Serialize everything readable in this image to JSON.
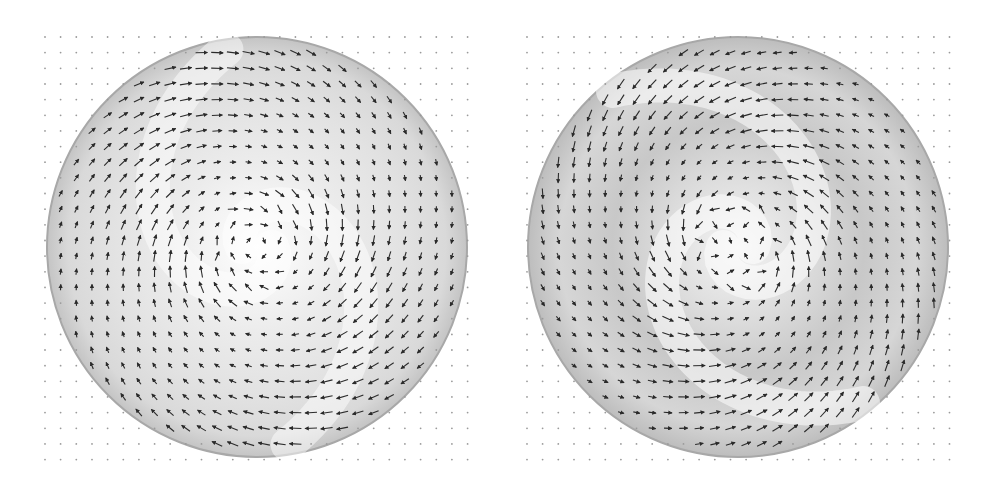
{
  "figure": {
    "background": "#ffffff",
    "dot_color": "#9a9a9a",
    "arrow_color": "#2a2a2a",
    "disc_edge_color": "#a8a8a8",
    "grid": {
      "cols": 28,
      "rows": 28,
      "spacing": 15.65
    }
  },
  "panels": [
    {
      "id": "left",
      "label": "Two-arm spiral vector field (counter-clockwise rotation, inward-spiraling)",
      "origin": {
        "x": 45,
        "y": 37
      },
      "center": {
        "x": 257,
        "y": 247
      },
      "radius": 210,
      "arms": 2,
      "twist": 1.1,
      "rotation": 1,
      "shading": "light"
    },
    {
      "id": "right",
      "label": "Two-arm spiral vector field with vortex core (clockwise rotation, darker shaded bands)",
      "origin": {
        "x": 527,
        "y": 37
      },
      "center": {
        "x": 738,
        "y": 247
      },
      "radius": 210,
      "arms": 2,
      "twist": 1.3,
      "rotation": -1,
      "shading": "dark"
    }
  ]
}
